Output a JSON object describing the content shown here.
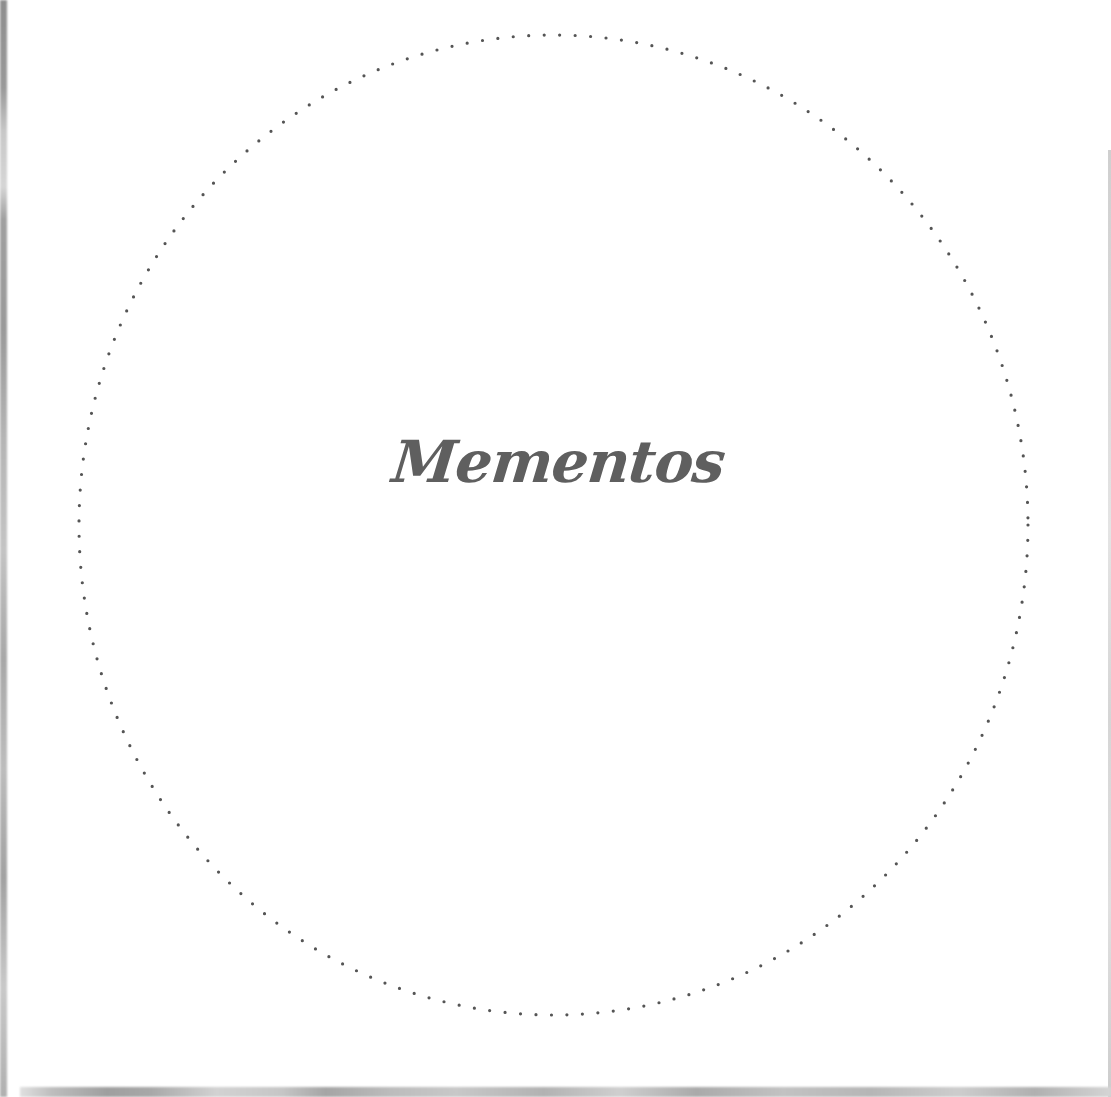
{
  "card": {
    "title": "Mementos",
    "text_color": "#5f5f5f",
    "ring": {
      "style": "dotted",
      "color": "#555555",
      "dot_diameter_px": 3,
      "dot_spacing_px": 15.5
    },
    "background_color": "#ffffff"
  }
}
